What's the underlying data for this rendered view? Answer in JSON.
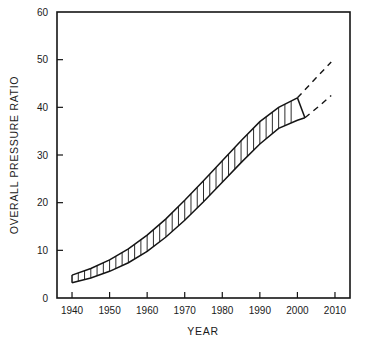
{
  "chart_data": {
    "type": "area",
    "title": "",
    "xlabel": "YEAR",
    "ylabel": "OVERALL PRESSURE RATIO",
    "xlim": [
      1936,
      2014
    ],
    "ylim": [
      0,
      60
    ],
    "xticks": [
      1940,
      1950,
      1960,
      1970,
      1980,
      1990,
      2000,
      2010
    ],
    "xtick_labels": [
      "1940",
      "1950",
      "1960",
      "1970",
      "1980",
      "1990",
      "2000",
      "2010"
    ],
    "yticks": [
      0,
      10,
      20,
      30,
      40,
      50,
      60
    ],
    "ytick_labels": [
      "0",
      "10",
      "20",
      "30",
      "40",
      "50",
      "60"
    ],
    "grid": false,
    "legend": "none",
    "series": [
      {
        "name": "Upper bound of overall pressure ratio band",
        "style": "solid",
        "x": [
          1940,
          1945,
          1950,
          1955,
          1960,
          1965,
          1970,
          1975,
          1980,
          1985,
          1990,
          1995,
          2000
        ],
        "values": [
          4.8,
          6.2,
          8.0,
          10.3,
          13.2,
          16.6,
          20.5,
          24.6,
          28.8,
          33.0,
          37.0,
          40.0,
          42.0
        ]
      },
      {
        "name": "Lower bound of overall pressure ratio band",
        "style": "solid",
        "x": [
          1940,
          1945,
          1950,
          1955,
          1960,
          1965,
          1970,
          1975,
          1980,
          1985,
          1990,
          1995,
          2000,
          2002
        ],
        "values": [
          3.2,
          4.2,
          5.6,
          7.4,
          9.8,
          12.8,
          16.3,
          20.2,
          24.3,
          28.4,
          32.3,
          35.6,
          37.3,
          37.8
        ]
      },
      {
        "name": "Upper bound projection",
        "style": "dashed",
        "x": [
          2000,
          2005,
          2009
        ],
        "values": [
          42.0,
          46.2,
          49.5
        ]
      },
      {
        "name": "Lower bound projection",
        "style": "dashed",
        "x": [
          2002,
          2006,
          2009
        ],
        "values": [
          37.8,
          40.4,
          42.5
        ]
      }
    ],
    "annotations": [],
    "band_shading": "vertical-hatch",
    "hatch_count": 36
  },
  "axes": {
    "y_title": "OVERALL PRESSURE RATIO",
    "x_title": "YEAR"
  }
}
